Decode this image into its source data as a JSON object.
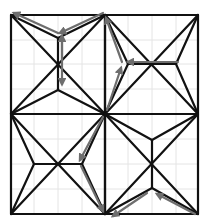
{
  "diagram": {
    "type": "crease-pattern",
    "colors": {
      "background": "#ffffff",
      "grid": "#e4e4e4",
      "crease": "#111111",
      "arrow": "#6e6e6e"
    },
    "outer_square": {
      "x1": 11,
      "y1": 15,
      "x2": 198,
      "y2": 214
    },
    "grid": {
      "vertical": [
        34,
        58,
        82,
        128,
        152,
        176
      ],
      "horizontal": [
        40,
        64,
        89,
        139,
        164,
        189
      ]
    },
    "quadrants": [
      {
        "name": "top-left",
        "x1": 11,
        "y1": 15,
        "x2": 105,
        "y2": 114,
        "axis": "vertical",
        "notch_a": [
          58,
          38
        ],
        "notch_b": [
          58,
          90
        ]
      },
      {
        "name": "top-right",
        "x1": 105,
        "y1": 15,
        "x2": 198,
        "y2": 114,
        "axis": "horizontal",
        "notch_a": [
          128,
          64
        ],
        "notch_b": [
          176,
          64
        ]
      },
      {
        "name": "bottom-left",
        "x1": 11,
        "y1": 114,
        "x2": 105,
        "y2": 214,
        "axis": "horizontal",
        "notch_a": [
          34,
          164
        ],
        "notch_b": [
          82,
          164
        ]
      },
      {
        "name": "bottom-right",
        "x1": 105,
        "y1": 114,
        "x2": 198,
        "y2": 214,
        "axis": "vertical",
        "notch_a": [
          152,
          140
        ],
        "notch_b": [
          152,
          188
        ]
      }
    ],
    "arrows": [
      {
        "name": "top-left-to-corner",
        "from": [
          58,
          33
        ],
        "to": [
          14,
          13
        ]
      },
      {
        "name": "top-center-to-notch",
        "from": [
          103,
          13
        ],
        "to": [
          60,
          33
        ]
      },
      {
        "name": "top-left-vertical-down",
        "from": [
          62,
          40
        ],
        "to": [
          62,
          84
        ]
      },
      {
        "name": "top-left-vertical-up",
        "from": [
          62,
          60
        ],
        "to": [
          62,
          36
        ]
      },
      {
        "name": "top-right-horizontal",
        "from": [
          178,
          62
        ],
        "to": [
          128,
          62
        ]
      },
      {
        "name": "center-up-to-notch",
        "from": [
          107,
          110
        ],
        "to": [
          121,
          68
        ]
      },
      {
        "name": "notch-to-top-center",
        "from": [
          122,
          62
        ],
        "to": [
          106,
          18
        ]
      },
      {
        "name": "center-down-to-notch",
        "from": [
          103,
          117
        ],
        "to": [
          80,
          160
        ]
      },
      {
        "name": "notch-to-bottom-center",
        "from": [
          81,
          166
        ],
        "to": [
          103,
          211
        ]
      },
      {
        "name": "bottom-right-to-notch",
        "from": [
          195,
          214
        ],
        "to": [
          157,
          194
        ]
      },
      {
        "name": "notch-to-bottom-left",
        "from": [
          147,
          193
        ],
        "to": [
          113,
          216
        ]
      }
    ]
  }
}
